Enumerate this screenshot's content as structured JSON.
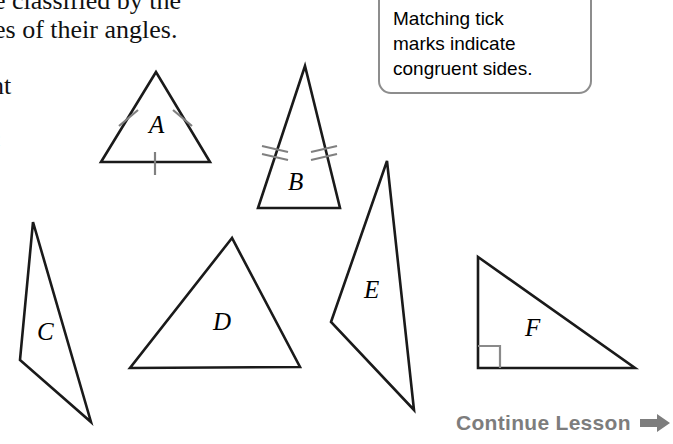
{
  "page": {
    "background_color": "#ffffff",
    "width": 673,
    "height": 444
  },
  "lesson_text": {
    "line1": "e classified by the",
    "line2": "es of their angles.",
    "line3": "nt",
    "line4": "c"
  },
  "callout": {
    "line1": "Matching tick",
    "line2": "marks indicate",
    "line3": "congruent sides.",
    "border_color": "#8d8d8d"
  },
  "diagram": {
    "stroke_color": "#1a1a1a",
    "tick_color": "#808080",
    "triangles": [
      {
        "label": "A",
        "type": "equilateral",
        "points": "156,72 101,162 210,162",
        "label_x": 149,
        "label_y": 133,
        "tick_count": 1
      },
      {
        "label": "B",
        "type": "isosceles",
        "points": "305,66 258,208 340,208",
        "label_x": 288,
        "label_y": 190,
        "tick_count": 2
      },
      {
        "label": "C",
        "type": "scalene-obtuse",
        "points": "33,222 20,360 91,422",
        "label_x": 37,
        "label_y": 340,
        "tick_count": 0
      },
      {
        "label": "D",
        "type": "acute-scalene",
        "points": "232,238 130,368 300,367",
        "label_x": 213,
        "label_y": 330,
        "tick_count": 0
      },
      {
        "label": "E",
        "type": "scalene-obtuse",
        "points": "387,161 331,322 414,410",
        "label_x": 364,
        "label_y": 298,
        "tick_count": 0
      },
      {
        "label": "F",
        "type": "right",
        "points": "478,257 478,368 635,368",
        "label_x": 525,
        "label_y": 336,
        "tick_count": 0,
        "right_angle_mark": true
      }
    ]
  },
  "footer": {
    "continue_label": "Continue Lesson",
    "arrow_color": "#7d7d7d",
    "text_color": "#7d7d7d"
  }
}
